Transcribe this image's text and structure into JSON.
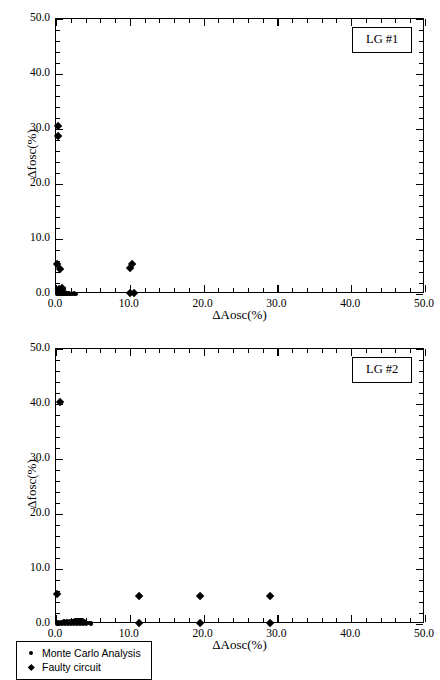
{
  "chart_data": [
    {
      "type": "scatter",
      "panel_id": "LG #1",
      "title": "",
      "xlabel": "ΔAosc(%)",
      "ylabel": "Δfosc(%)",
      "xlim": [
        0,
        50
      ],
      "ylim": [
        0,
        50
      ],
      "xticks": [
        "0.0",
        "10.0",
        "20.0",
        "30.0",
        "40.0",
        "50.0"
      ],
      "yticks": [
        "0.0",
        "10.0",
        "20.0",
        "30.0",
        "40.0",
        "50.0"
      ],
      "xtick_values": [
        0,
        10,
        20,
        30,
        40,
        50
      ],
      "ytick_values": [
        0,
        10,
        20,
        30,
        40,
        50
      ],
      "minor_tick_step": 2,
      "grid": false,
      "legend_position": "none",
      "series": [
        {
          "name": "Monte Carlo Analysis",
          "marker": "circle",
          "color": "#000000",
          "points": [
            [
              0.1,
              0.05
            ],
            [
              0.25,
              0.05
            ],
            [
              0.4,
              0.05
            ],
            [
              0.55,
              0.05
            ],
            [
              0.7,
              0.05
            ],
            [
              0.85,
              0.05
            ],
            [
              1.0,
              0.05
            ],
            [
              1.15,
              0.05
            ],
            [
              1.3,
              0.05
            ],
            [
              1.45,
              0.05
            ],
            [
              1.6,
              0.05
            ],
            [
              1.75,
              0.05
            ],
            [
              1.95,
              0.05
            ],
            [
              2.15,
              0.05
            ],
            [
              0.15,
              0.35
            ],
            [
              0.35,
              0.35
            ],
            [
              0.55,
              0.35
            ],
            [
              0.75,
              0.35
            ],
            [
              0.95,
              0.4
            ],
            [
              1.15,
              0.35
            ],
            [
              0.3,
              0.7
            ],
            [
              0.6,
              0.75
            ],
            [
              0.9,
              0.8
            ],
            [
              1.1,
              0.85
            ],
            [
              0.45,
              1.05
            ],
            [
              0.8,
              1.1
            ],
            [
              1.0,
              1.15
            ],
            [
              0.2,
              0.2
            ],
            [
              0.5,
              0.2
            ],
            [
              0.9,
              0.2
            ],
            [
              1.3,
              0.2
            ],
            [
              1.7,
              0.12
            ],
            [
              2.4,
              0.08
            ],
            [
              2.7,
              0.06
            ]
          ]
        },
        {
          "name": "Faulty circuit",
          "marker": "diamond",
          "color": "#000000",
          "points": [
            [
              0.3,
              30.6
            ],
            [
              0.3,
              28.8
            ],
            [
              0.2,
              5.4
            ],
            [
              0.5,
              4.6
            ],
            [
              10.3,
              5.5
            ],
            [
              10.1,
              4.8
            ],
            [
              10.0,
              0.1
            ],
            [
              10.6,
              0.1
            ],
            [
              0.4,
              0.9
            ],
            [
              0.8,
              1.1
            ]
          ]
        }
      ]
    },
    {
      "type": "scatter",
      "panel_id": "LG #2",
      "title": "",
      "xlabel": "ΔAosc(%)",
      "ylabel": "Δfosc(%)",
      "xlim": [
        0,
        50
      ],
      "ylim": [
        0,
        50
      ],
      "xticks": [
        "0.0",
        "10.0",
        "20.0",
        "30.0",
        "40.0",
        "50.0"
      ],
      "yticks": [
        "0.0",
        "10.0",
        "20.0",
        "30.0",
        "40.0",
        "50.0"
      ],
      "xtick_values": [
        0,
        10,
        20,
        30,
        40,
        50
      ],
      "ytick_values": [
        0,
        10,
        20,
        30,
        40,
        50
      ],
      "minor_tick_step": 2,
      "grid": false,
      "legend_position": "below-left",
      "series": [
        {
          "name": "Monte Carlo Analysis",
          "marker": "circle",
          "color": "#000000",
          "points": [
            [
              0.15,
              0.1
            ],
            [
              0.35,
              0.1
            ],
            [
              0.55,
              0.12
            ],
            [
              0.75,
              0.15
            ],
            [
              0.95,
              0.18
            ],
            [
              1.15,
              0.22
            ],
            [
              1.35,
              0.28
            ],
            [
              1.55,
              0.32
            ],
            [
              1.75,
              0.38
            ],
            [
              1.95,
              0.42
            ],
            [
              2.15,
              0.48
            ],
            [
              2.35,
              0.52
            ],
            [
              2.55,
              0.55
            ],
            [
              2.75,
              0.58
            ],
            [
              2.95,
              0.62
            ],
            [
              3.15,
              0.65
            ],
            [
              3.35,
              0.68
            ],
            [
              3.55,
              0.62
            ],
            [
              3.75,
              0.52
            ],
            [
              3.95,
              0.4
            ],
            [
              0.25,
              0.35
            ],
            [
              0.65,
              0.4
            ],
            [
              1.05,
              0.45
            ],
            [
              1.45,
              0.5
            ],
            [
              1.85,
              0.55
            ],
            [
              2.25,
              0.6
            ],
            [
              2.65,
              0.64
            ],
            [
              3.05,
              0.7
            ],
            [
              3.45,
              0.72
            ],
            [
              4.15,
              0.25
            ],
            [
              4.45,
              0.15
            ],
            [
              4.75,
              0.1
            ],
            [
              0.45,
              0.05
            ],
            [
              0.85,
              0.05
            ],
            [
              1.25,
              0.05
            ],
            [
              1.65,
              0.05
            ],
            [
              2.05,
              0.05
            ],
            [
              2.45,
              0.05
            ],
            [
              2.85,
              0.05
            ],
            [
              3.25,
              0.05
            ],
            [
              3.65,
              0.05
            ],
            [
              4.05,
              0.05
            ]
          ]
        },
        {
          "name": "Faulty circuit",
          "marker": "diamond",
          "color": "#000000",
          "points": [
            [
              0.5,
              40.3
            ],
            [
              0.2,
              5.4
            ],
            [
              11.3,
              5.0
            ],
            [
              19.5,
              5.0
            ],
            [
              29.0,
              5.0
            ],
            [
              11.3,
              0.1
            ],
            [
              19.5,
              0.1
            ],
            [
              29.0,
              0.1
            ]
          ]
        }
      ]
    }
  ],
  "panels": {
    "top": {
      "id_label": "LG #1"
    },
    "bottom": {
      "id_label": "LG #2"
    }
  },
  "legend": {
    "items": [
      {
        "label": "Monte Carlo Analysis",
        "marker": "circle-marker"
      },
      {
        "label": "Faulty circuit",
        "marker": "diamond-marker"
      }
    ]
  }
}
